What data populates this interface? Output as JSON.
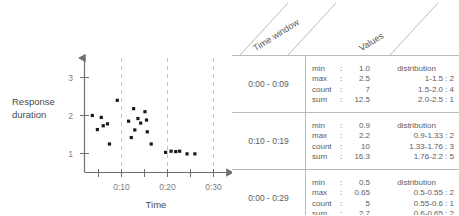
{
  "chart_data": {
    "type": "scatter",
    "title": "",
    "xlabel": "Time",
    "ylabel": "Response duration",
    "xticks": [
      "0:10",
      "0:20",
      "0:30"
    ],
    "yticks": [
      "1",
      "2",
      "3"
    ],
    "ylim": [
      0,
      3.4
    ],
    "xlim": [
      0,
      35
    ],
    "grid": "vertical-dashed-at-xticks",
    "legend": "none",
    "points": [
      {
        "x": 2.0,
        "y": 2.0
      },
      {
        "x": 3.3,
        "y": 1.63
      },
      {
        "x": 4.3,
        "y": 1.95
      },
      {
        "x": 4.8,
        "y": 1.73
      },
      {
        "x": 5.9,
        "y": 1.78
      },
      {
        "x": 6.4,
        "y": 1.25
      },
      {
        "x": 8.4,
        "y": 2.4
      },
      {
        "x": 11.3,
        "y": 1.85
      },
      {
        "x": 12.0,
        "y": 1.42
      },
      {
        "x": 12.6,
        "y": 2.18
      },
      {
        "x": 12.9,
        "y": 1.62
      },
      {
        "x": 13.7,
        "y": 1.92
      },
      {
        "x": 14.4,
        "y": 1.8
      },
      {
        "x": 15.5,
        "y": 2.1
      },
      {
        "x": 15.9,
        "y": 1.88
      },
      {
        "x": 16.1,
        "y": 1.57
      },
      {
        "x": 17.1,
        "y": 1.25
      },
      {
        "x": 20.8,
        "y": 1.03
      },
      {
        "x": 22.2,
        "y": 1.06
      },
      {
        "x": 23.4,
        "y": 1.05
      },
      {
        "x": 24.4,
        "y": 1.06
      },
      {
        "x": 26.3,
        "y": 0.99
      },
      {
        "x": 28.3,
        "y": 0.99
      }
    ]
  },
  "table": {
    "headers": {
      "time_window": "Time window",
      "values": "Values"
    },
    "rows": [
      {
        "time_window": "0:00 - 0:09",
        "stats": [
          {
            "key": "min",
            "sep": ":",
            "value": "1.0"
          },
          {
            "key": "max",
            "sep": ":",
            "value": "2.5"
          },
          {
            "key": "count",
            "sep": ":",
            "value": "7"
          },
          {
            "key": "sum",
            "sep": ":",
            "value": "12.5"
          }
        ],
        "distribution_label": "distribution",
        "distribution": [
          {
            "range": "1-1.5",
            "count": "2"
          },
          {
            "range": "1.5-2.0",
            "count": "4"
          },
          {
            "range": "2.0-2.5",
            "count": "1"
          }
        ]
      },
      {
        "time_window": "0:10 - 0:19",
        "stats": [
          {
            "key": "min",
            "sep": ":",
            "value": "0.9"
          },
          {
            "key": "max",
            "sep": ":",
            "value": "2.2"
          },
          {
            "key": "count",
            "sep": ":",
            "value": "10"
          },
          {
            "key": "sum",
            "sep": ":",
            "value": "16.3"
          }
        ],
        "distribution_label": "distribution",
        "distribution": [
          {
            "range": "0.9-1.33",
            "count": "2"
          },
          {
            "range": "1.33-1.76",
            "count": "3"
          },
          {
            "range": "1.76-2.2",
            "count": "5"
          }
        ]
      },
      {
        "time_window": "0:00 - 0:29",
        "stats": [
          {
            "key": "min",
            "sep": ":",
            "value": "0.5"
          },
          {
            "key": "max",
            "sep": ":",
            "value": "0.65"
          },
          {
            "key": "count",
            "sep": ":",
            "value": "5"
          },
          {
            "key": "sum",
            "sep": ":",
            "value": "2.7"
          }
        ],
        "distribution_label": "distribution",
        "distribution": [
          {
            "range": "0.5-0.55",
            "count": "2"
          },
          {
            "range": "0.55-0.6",
            "count": "1"
          },
          {
            "range": "0.6-0.65",
            "count": "2"
          }
        ]
      }
    ]
  },
  "colors": {
    "point": "#1a1a1a",
    "axis": "#6f6f6f",
    "grid": "#c4c4c4",
    "border": "#b9b9b9",
    "text": "#5d5d5d"
  }
}
